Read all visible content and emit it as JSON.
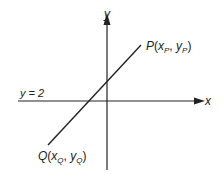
{
  "diagram": {
    "axes": {
      "x_label": "x",
      "y_label": "y"
    },
    "horizontal_line_label": "y = 2",
    "point_p": {
      "name": "P",
      "open": "(",
      "x_base": "x",
      "x_sub": "P",
      "sep": ", ",
      "y_base": "y",
      "y_sub": "P",
      "close": ")"
    },
    "point_q": {
      "name": "Q",
      "open": "(",
      "x_base": "x",
      "x_sub": "Q",
      "sep": ", ",
      "y_base": "y",
      "y_sub": "Q",
      "close": ")"
    },
    "colors": {
      "stroke": "#222222",
      "background": "#ffffff"
    }
  }
}
